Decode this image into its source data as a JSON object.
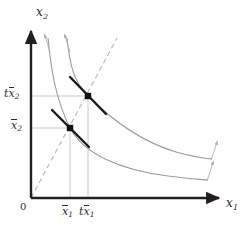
{
  "figure": {
    "axes": {
      "y_label": "x",
      "y_label_sub": "2",
      "x_label": "x",
      "x_label_sub": "1",
      "origin_label": "0",
      "axis_color": "#231f20"
    },
    "ticks": {
      "y": [
        {
          "name": "t-xbar-2",
          "prefix": "t",
          "base": "x",
          "sub": "2",
          "value_px": 96
        },
        {
          "name": "xbar-2",
          "prefix": "",
          "base": "x",
          "sub": "2",
          "value_px": 128
        }
      ],
      "x": [
        {
          "name": "xbar-1",
          "prefix": "",
          "base": "x",
          "sub": "1",
          "value_px": 70
        },
        {
          "name": "t-xbar-1",
          "prefix": "t",
          "base": "x",
          "sub": "1",
          "value_px": 88
        }
      ]
    },
    "colors": {
      "isoquant": "#9a9a9a",
      "gridline": "#c9c9c9",
      "ray_dashed": "#b4b4b4",
      "tangent": "#1a1a1a",
      "point": "#101010",
      "arrow": "#b0b0b0"
    },
    "points": [
      {
        "name": "lower-tangency-point",
        "x": 70,
        "y": 128
      },
      {
        "name": "upper-tangency-point",
        "x": 88,
        "y": 96
      }
    ],
    "isoquants": [
      {
        "name": "inner-isoquant",
        "path": "M 48,38 C 51,70 56,100 70,128 C 84,154 120,170 168,176 C 182,178 196,179 208,180"
      },
      {
        "name": "outer-isoquant",
        "path": "M 67,38 C 70,66 74,82 88,96 C 106,114 136,140 176,152 C 190,156 202,158 212,159"
      }
    ],
    "expansion_ray": {
      "name": "expansion-path-ray",
      "x1": 31,
      "y1": 198,
      "x2": 117,
      "y2": 38
    },
    "tangents": [
      {
        "name": "lower-tangent-line",
        "x1": 52,
        "y1": 111,
        "x2": 88,
        "y2": 146
      },
      {
        "name": "upper-tangent-line",
        "x1": 71,
        "y1": 78,
        "x2": 105,
        "y2": 114
      }
    ],
    "growth_arrows": [
      {
        "name": "growth-arrow-top-left",
        "x1": 50,
        "y1": 50,
        "x2": 44,
        "y2": 33
      },
      {
        "name": "growth-arrow-top-right",
        "x1": 70,
        "y1": 50,
        "x2": 64,
        "y2": 33
      },
      {
        "name": "growth-arrow-right-upper",
        "x1": 208,
        "y1": 180,
        "x2": 215,
        "y2": 160
      },
      {
        "name": "growth-arrow-right-lower",
        "x1": 212,
        "y1": 160,
        "x2": 219,
        "y2": 141
      }
    ]
  }
}
